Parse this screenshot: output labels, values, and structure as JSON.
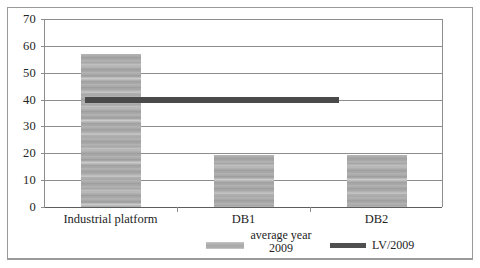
{
  "chart_data": {
    "type": "bar",
    "title": "",
    "subtitle": "",
    "xlabel": "",
    "ylabel": "",
    "categories": [
      "Industrial platform",
      "DB1",
      "DB2"
    ],
    "series": [
      {
        "name": "average year 2009",
        "type": "bar",
        "color": "#a9a9a9",
        "values": [
          57,
          19.5,
          19.5
        ]
      },
      {
        "name": "LV/2009",
        "type": "line",
        "color": "#4a4a4a",
        "constant_value": 40,
        "values": [
          40,
          40,
          40
        ]
      }
    ],
    "ylim": [
      0,
      70
    ],
    "ytick_values": [
      0,
      10,
      20,
      30,
      40,
      50,
      60,
      70
    ],
    "ytick_labels": [
      "0",
      "10",
      "20",
      "30",
      "40",
      "50",
      "60",
      "70"
    ],
    "grid": true,
    "grid_axis": "y",
    "legend_position": "bottom"
  },
  "axes": {
    "y": {
      "ticks": [
        {
          "value": 70,
          "label": "70"
        },
        {
          "value": 60,
          "label": "60"
        },
        {
          "value": 50,
          "label": "50"
        },
        {
          "value": 40,
          "label": "40"
        },
        {
          "value": 30,
          "label": "30"
        },
        {
          "value": 20,
          "label": "20"
        },
        {
          "value": 10,
          "label": "10"
        },
        {
          "value": 0,
          "label": "0"
        }
      ]
    },
    "x": {
      "ticks": [
        {
          "label": "Industrial platform"
        },
        {
          "label": "DB1"
        },
        {
          "label": "DB2"
        }
      ]
    }
  },
  "legend": {
    "average": {
      "line1": "average year",
      "line2": "2009",
      "swatch_color": "#b0b0b0"
    },
    "threshold": {
      "label": "LV/2009",
      "swatch_color": "#4f4f4f"
    }
  }
}
